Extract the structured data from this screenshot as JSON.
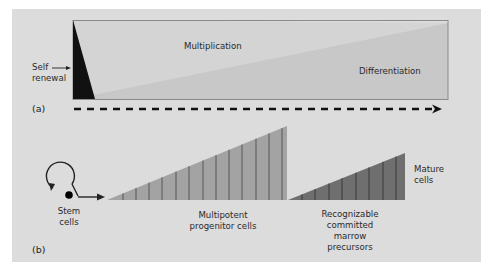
{
  "panel_a": {
    "label": "(a)",
    "self_renewal": "Self renewal",
    "self_renewal_line1": "Self",
    "self_renewal_line2": "renewal",
    "multiplication": "Multiplication",
    "differentiation": "Differentiation"
  },
  "panel_b": {
    "label": "(b)",
    "stem_cells_line1": "Stem",
    "stem_cells_line2": "cells",
    "progenitor_line1": "Multipotent",
    "progenitor_line2": "progenitor cells",
    "precursors_line1": "Recognizable",
    "precursors_line2": "committed",
    "precursors_line3": "marrow",
    "precursors_line4": "precursors",
    "mature_line1": "Mature",
    "mature_line2": "cells"
  },
  "colors": {
    "panel_bg": "#dcdcdc",
    "multiplication_region": "#d2d2d2",
    "differentiation_region": "#c9c9c9",
    "self_renewal_wedge": "#111111",
    "progenitor_triangle": "#a3a3a3",
    "precursor_triangle": "#727272",
    "stripe": "#4a4a4a"
  }
}
